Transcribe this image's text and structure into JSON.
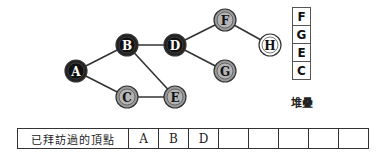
{
  "graph": {
    "nodes": [
      {
        "id": "A",
        "label": "A",
        "x": 76,
        "y": 71,
        "state": "visited"
      },
      {
        "id": "B",
        "label": "B",
        "x": 127,
        "y": 45,
        "state": "visited"
      },
      {
        "id": "D",
        "label": "D",
        "x": 175,
        "y": 45,
        "state": "visited"
      },
      {
        "id": "F",
        "label": "F",
        "x": 225,
        "y": 20,
        "state": "stacked"
      },
      {
        "id": "H",
        "label": "H",
        "x": 270,
        "y": 45,
        "state": "unvisited"
      },
      {
        "id": "G",
        "label": "G",
        "x": 225,
        "y": 71,
        "state": "stacked"
      },
      {
        "id": "C",
        "label": "C",
        "x": 127,
        "y": 97,
        "state": "stacked"
      },
      {
        "id": "E",
        "label": "E",
        "x": 175,
        "y": 97,
        "state": "stacked"
      }
    ],
    "edges": [
      [
        "A",
        "B"
      ],
      [
        "A",
        "C"
      ],
      [
        "B",
        "D"
      ],
      [
        "B",
        "E"
      ],
      [
        "C",
        "E"
      ],
      [
        "D",
        "F"
      ],
      [
        "D",
        "G"
      ],
      [
        "F",
        "H"
      ]
    ],
    "colors": {
      "visited": "#222222",
      "stacked": "#9a9a9a",
      "unvisited": "#ffffff",
      "edge": "#333333"
    }
  },
  "stack": {
    "items": [
      "F",
      "G",
      "E",
      "C"
    ],
    "label": "堆疊"
  },
  "visited_table": {
    "header": "已拜訪過的頂點",
    "cells": [
      "A",
      "B",
      "D",
      "",
      "",
      "",
      "",
      ""
    ]
  }
}
